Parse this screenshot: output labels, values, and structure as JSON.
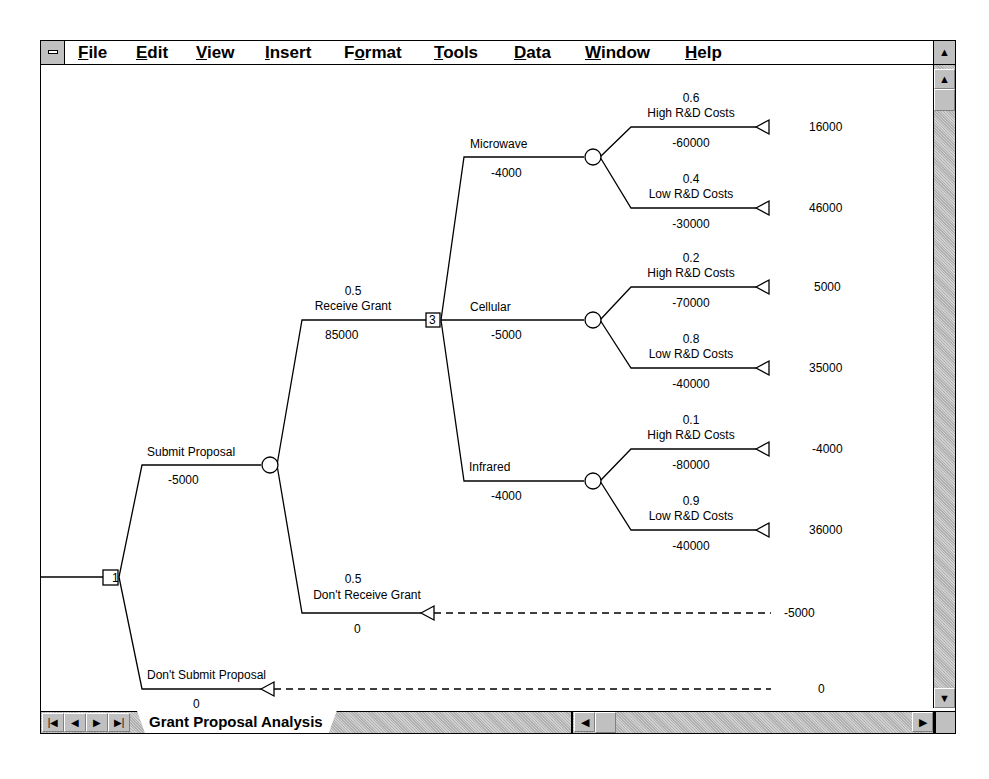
{
  "menubar": {
    "items": [
      {
        "label": "File",
        "mnemonic": "F"
      },
      {
        "label": "Edit",
        "mnemonic": "E"
      },
      {
        "label": "View",
        "mnemonic": "V"
      },
      {
        "label": "Insert",
        "mnemonic": "I"
      },
      {
        "label": "Format",
        "mnemonic": "o"
      },
      {
        "label": "Tools",
        "mnemonic": "T"
      },
      {
        "label": "Data",
        "mnemonic": "D"
      },
      {
        "label": "Window",
        "mnemonic": "W"
      },
      {
        "label": "Help",
        "mnemonic": "H"
      }
    ],
    "system_icon": "system-menu-icon",
    "restore_icon": "restore-arrows-icon"
  },
  "sheet_tabs": {
    "active": "Grant Proposal Analysis",
    "nav_icons": [
      "first-sheet-icon",
      "prev-sheet-icon",
      "next-sheet-icon",
      "last-sheet-icon"
    ]
  },
  "tree": {
    "root_decision": {
      "id": "1"
    },
    "branches": {
      "submit": {
        "label": "Submit Proposal",
        "value": "-5000"
      },
      "dont_submit": {
        "label": "Don't Submit Proposal",
        "value": "0",
        "payoff": "0"
      },
      "receive": {
        "prob": "0.5",
        "label": "Receive Grant",
        "value": "85000"
      },
      "dont_receive": {
        "prob": "0.5",
        "label": "Don't Receive Grant",
        "value": "0",
        "payoff": "-5000"
      },
      "tech_decision": {
        "id": "3"
      },
      "microwave": {
        "label": "Microwave",
        "value": "-4000",
        "high": {
          "prob": "0.6",
          "label": "High R&D Costs",
          "value": "-60000",
          "payoff": "16000"
        },
        "low": {
          "prob": "0.4",
          "label": "Low R&D Costs",
          "value": "-30000",
          "payoff": "46000"
        }
      },
      "cellular": {
        "label": "Cellular",
        "value": "-5000",
        "high": {
          "prob": "0.2",
          "label": "High R&D Costs",
          "value": "-70000",
          "payoff": "5000"
        },
        "low": {
          "prob": "0.8",
          "label": "Low R&D Costs",
          "value": "-40000",
          "payoff": "35000"
        }
      },
      "infrared": {
        "label": "Infrared",
        "value": "-4000",
        "high": {
          "prob": "0.1",
          "label": "High R&D Costs",
          "value": "-80000",
          "payoff": "-4000"
        },
        "low": {
          "prob": "0.9",
          "label": "Low R&D Costs",
          "value": "-40000",
          "payoff": "36000"
        }
      }
    }
  }
}
